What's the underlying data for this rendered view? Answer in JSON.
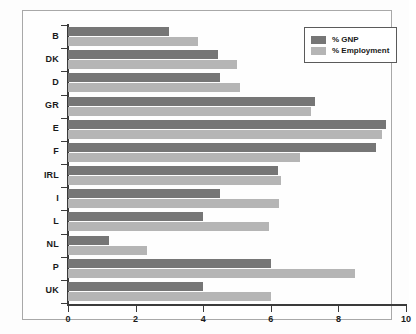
{
  "chart_data": {
    "type": "bar",
    "orientation": "horizontal",
    "title": "",
    "subtitle": "",
    "xlabel": "",
    "ylabel": "",
    "xlim": [
      0,
      10
    ],
    "xticks": [
      0,
      2,
      4,
      6,
      8,
      10
    ],
    "xtick_labels": [
      "0",
      "2",
      "4",
      "6",
      "8",
      "10"
    ],
    "grid": false,
    "legend_position": "top-right",
    "categories": [
      "B",
      "DK",
      "D",
      "GR",
      "E",
      "F",
      "IRL",
      "I",
      "L",
      "NL",
      "P",
      "UK"
    ],
    "series": [
      {
        "name": "% GNP",
        "color": "#767676",
        "values": [
          3.0,
          4.45,
          4.5,
          7.3,
          9.4,
          9.1,
          6.2,
          4.5,
          4.0,
          1.2,
          6.0,
          4.0
        ]
      },
      {
        "name": "% Employment",
        "color": "#b5b5b5",
        "values": [
          3.85,
          5.0,
          5.1,
          7.2,
          9.3,
          6.85,
          6.3,
          6.25,
          5.95,
          2.35,
          8.5,
          6.0
        ]
      }
    ]
  },
  "legend": {
    "items": [
      {
        "label": "% GNP",
        "color": "#767676"
      },
      {
        "label": "% Employment",
        "color": "#b5b5b5"
      }
    ]
  },
  "colors": {
    "gnp": "#767676",
    "employment": "#b5b5b5",
    "axis": "#3a3a3a",
    "frame": "#a8a8a8",
    "text": "#1a1a1a",
    "background": "#fefefe"
  }
}
